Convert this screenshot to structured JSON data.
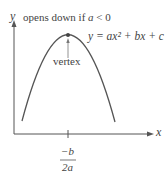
{
  "diagram": {
    "y_axis_label": "y",
    "x_axis_label": "x",
    "note": "opens down if a < 0",
    "note_parts": {
      "text": "opens down if ",
      "var": "a",
      "rel": " < 0"
    },
    "equation": "y = ax² + bx + c",
    "vertex_label": "vertex",
    "tick_label_numerator": "−b",
    "tick_label_denominator": "2a",
    "colors": {
      "curve": "#555555",
      "axis": "#555555",
      "text": "#444444"
    }
  }
}
